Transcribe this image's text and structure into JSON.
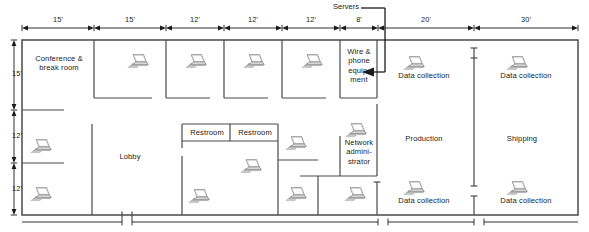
{
  "diagram": {
    "wall_color": "#4a4a4a",
    "text_color": "#232323",
    "background": "#ffffff"
  },
  "callouts": [
    {
      "name": "servers-callout",
      "label": "Servers",
      "x": 333,
      "y": 2
    }
  ],
  "top_dimensions": [
    {
      "label": "15'",
      "x1": 22,
      "x2": 94
    },
    {
      "label": "15'",
      "x1": 94,
      "x2": 166
    },
    {
      "label": "12'",
      "x1": 166,
      "x2": 224
    },
    {
      "label": "12'",
      "x1": 224,
      "x2": 282
    },
    {
      "label": "12'",
      "x1": 282,
      "x2": 340
    },
    {
      "label": "8'",
      "x1": 340,
      "x2": 378
    },
    {
      "label": "20'",
      "x1": 378,
      "x2": 474
    },
    {
      "label": "30'",
      "x1": 474,
      "x2": 578
    }
  ],
  "left_dimensions": [
    {
      "label": "15'",
      "y1": 40,
      "y2": 110
    },
    {
      "label": "12'",
      "y1": 110,
      "y2": 163
    },
    {
      "label": "12'",
      "y1": 163,
      "y2": 215
    }
  ],
  "rooms": [
    {
      "name": "conference-break-room",
      "label": "Conference &\nbreak room",
      "x": 28,
      "y": 54,
      "w": 62,
      "h": 22
    },
    {
      "name": "wire-phone-equipment-room",
      "label": "Wire &\nphone\nequip-\nment",
      "x": 341,
      "y": 47,
      "w": 36,
      "h": 44
    },
    {
      "name": "network-administrator-room",
      "label": "Network\nadmini-\nstrator",
      "x": 341,
      "y": 138,
      "w": 36,
      "h": 32
    },
    {
      "name": "lobby",
      "label": "Lobby",
      "x": 110,
      "y": 152,
      "w": 40,
      "h": 11
    },
    {
      "name": "restroom-left",
      "label": "Restroom",
      "x": 186,
      "y": 128,
      "w": 44,
      "h": 11
    },
    {
      "name": "restroom-right",
      "label": "Restroom",
      "x": 232,
      "y": 128,
      "w": 44,
      "h": 11
    },
    {
      "name": "production-area",
      "label": "Production",
      "x": 396,
      "y": 134,
      "w": 56,
      "h": 11
    },
    {
      "name": "shipping-area",
      "label": "Shipping",
      "x": 497,
      "y": 134,
      "w": 50,
      "h": 11
    },
    {
      "name": "data-collection-top-left",
      "label": "Data collection",
      "x": 386,
      "y": 71,
      "w": 76,
      "h": 11
    },
    {
      "name": "data-collection-top-right",
      "label": "Data collection",
      "x": 488,
      "y": 71,
      "w": 76,
      "h": 11
    },
    {
      "name": "data-collection-bottom-left",
      "label": "Data collection",
      "x": 386,
      "y": 196,
      "w": 76,
      "h": 11
    },
    {
      "name": "data-collection-bottom-right",
      "label": "Data collection",
      "x": 488,
      "y": 196,
      "w": 76,
      "h": 11
    }
  ],
  "laptops": [
    {
      "name": "laptop-office-1",
      "x": 127,
      "y": 53
    },
    {
      "name": "laptop-office-2",
      "x": 185,
      "y": 53
    },
    {
      "name": "laptop-office-3",
      "x": 243,
      "y": 53
    },
    {
      "name": "laptop-office-4",
      "x": 301,
      "y": 53
    },
    {
      "name": "laptop-data-collection-top-left",
      "x": 403,
      "y": 55
    },
    {
      "name": "laptop-data-collection-top-right",
      "x": 506,
      "y": 55
    },
    {
      "name": "laptop-network-admin",
      "x": 345,
      "y": 122
    },
    {
      "name": "laptop-left-upper",
      "x": 30,
      "y": 138
    },
    {
      "name": "laptop-left-lower",
      "x": 30,
      "y": 186
    },
    {
      "name": "laptop-hall-center",
      "x": 240,
      "y": 158
    },
    {
      "name": "laptop-right-of-restroom",
      "x": 285,
      "y": 135
    },
    {
      "name": "laptop-lower-center",
      "x": 188,
      "y": 188
    },
    {
      "name": "laptop-lower-right-inner",
      "x": 285,
      "y": 186
    },
    {
      "name": "laptop-lower-admin",
      "x": 344,
      "y": 186
    },
    {
      "name": "laptop-data-collection-bottom-left",
      "x": 403,
      "y": 180
    },
    {
      "name": "laptop-data-collection-bottom-right",
      "x": 506,
      "y": 180
    }
  ]
}
